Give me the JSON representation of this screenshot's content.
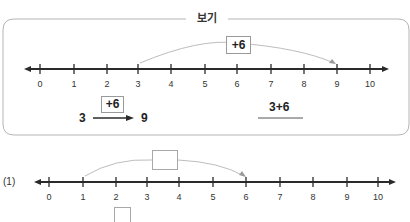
{
  "example": {
    "title": "보기",
    "number_line": {
      "labels": [
        "0",
        "1",
        "2",
        "3",
        "4",
        "5",
        "6",
        "7",
        "8",
        "9",
        "10"
      ],
      "jump_from": 3,
      "jump_to": 9,
      "jump_label": "+6"
    },
    "arrow_diagram": {
      "start": "3",
      "operation": "+6",
      "end": "9"
    },
    "expression": "3+6"
  },
  "problem_1": {
    "number": "(1)",
    "number_line": {
      "labels": [
        "0",
        "1",
        "2",
        "3",
        "4",
        "5",
        "6",
        "7",
        "8",
        "9",
        "10"
      ],
      "jump_from": 1,
      "jump_to": 6,
      "jump_label": ""
    },
    "answer_blank": ""
  },
  "colors": {
    "border": "#b5b5b5",
    "line": "#2a2a2a",
    "arc": "#bdbdbd",
    "box_border": "#9a9a9a"
  }
}
